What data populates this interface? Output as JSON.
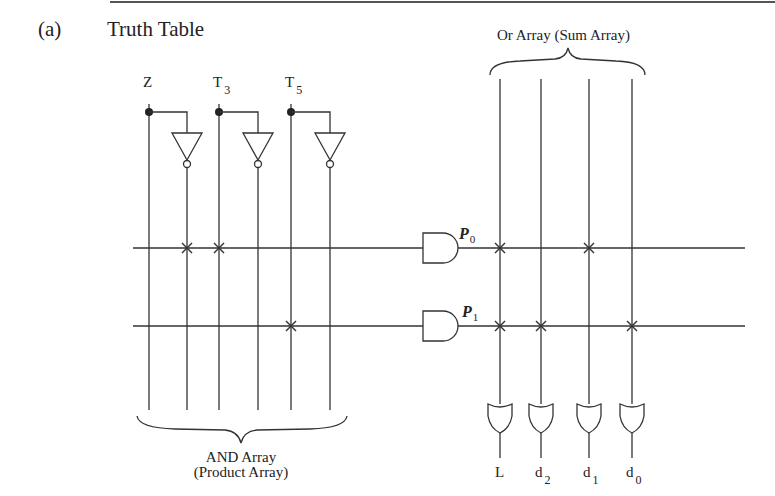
{
  "figure": {
    "part_label": "(a)",
    "title": "Truth Table",
    "inputs": [
      {
        "name": "Z",
        "sub": ""
      },
      {
        "name": "T",
        "sub": "3"
      },
      {
        "name": "T",
        "sub": "5"
      }
    ],
    "products": [
      {
        "name": "P",
        "sub": "0"
      },
      {
        "name": "P",
        "sub": "1"
      }
    ],
    "outputs": [
      {
        "name": "L",
        "sub": ""
      },
      {
        "name": "d",
        "sub": "2"
      },
      {
        "name": "d",
        "sub": "1"
      },
      {
        "name": "d",
        "sub": "0"
      }
    ],
    "and_array_label_line1": "AND Array",
    "and_array_label_line2": "(Product Array)",
    "or_array_label": "Or Array (Sum Array)",
    "and_connections": {
      "P0": [
        "Z'",
        "T3"
      ],
      "P1": [
        "T5"
      ]
    },
    "or_connections": {
      "P0": [
        "L",
        "d1"
      ],
      "P1": [
        "L",
        "d2",
        "d0"
      ]
    }
  }
}
